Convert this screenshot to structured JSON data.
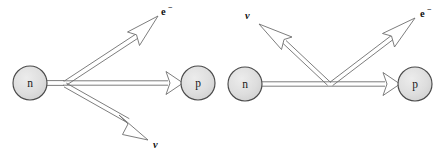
{
  "figure": {
    "background_color": "#ffffff",
    "line_color": "#6e6e6e",
    "node_fill_color": "#dedede",
    "node_stroke_color": "#4a4a4a",
    "label_color": "#111111"
  },
  "diagrams": [
    {
      "id": "left",
      "name": "beta-decay",
      "nodes": [
        {
          "id": "neutron",
          "label": "n",
          "cx": 30,
          "cy": 83,
          "r": 17
        },
        {
          "id": "proton",
          "label": "p",
          "cx": 198,
          "cy": 83,
          "r": 17
        }
      ],
      "vertex": {
        "x": 63,
        "y": 83
      },
      "particles": [
        {
          "id": "electron",
          "label": "e",
          "superscript": "−",
          "label_x": 163,
          "label_y": 12,
          "tip_x": 158,
          "tip_y": 16,
          "direction": "outgoing-up-right"
        },
        {
          "id": "neutrino",
          "label": "ν",
          "superscript": "",
          "label_x": 156,
          "label_y": 145,
          "tip_x": 148,
          "tip_y": 140,
          "direction": "outgoing-down-right"
        },
        {
          "id": "proton-line",
          "label": "",
          "superscript": "",
          "label_x": 0,
          "label_y": 0,
          "tip_x": 181,
          "tip_y": 83,
          "direction": "outgoing-right"
        }
      ]
    },
    {
      "id": "right",
      "name": "inverse-beta-decay",
      "nodes": [
        {
          "id": "neutron",
          "label": "n",
          "cx": 245,
          "cy": 84,
          "r": 17
        },
        {
          "id": "proton",
          "label": "p",
          "cx": 415,
          "cy": 84,
          "r": 17
        }
      ],
      "vertex": {
        "x": 330,
        "y": 84
      },
      "particles": [
        {
          "id": "neutrino",
          "label": "ν",
          "superscript": "",
          "label_x": 249,
          "label_y": 16,
          "tip_x": 259,
          "tip_y": 24,
          "direction": "incoming-up-left"
        },
        {
          "id": "electron",
          "label": "e",
          "superscript": "−",
          "label_x": 422,
          "label_y": 14,
          "tip_x": 415,
          "tip_y": 18,
          "direction": "outgoing-up-right"
        },
        {
          "id": "proton-line",
          "label": "",
          "superscript": "",
          "label_x": 0,
          "label_y": 0,
          "tip_x": 398,
          "tip_y": 84,
          "direction": "outgoing-right"
        }
      ]
    }
  ]
}
